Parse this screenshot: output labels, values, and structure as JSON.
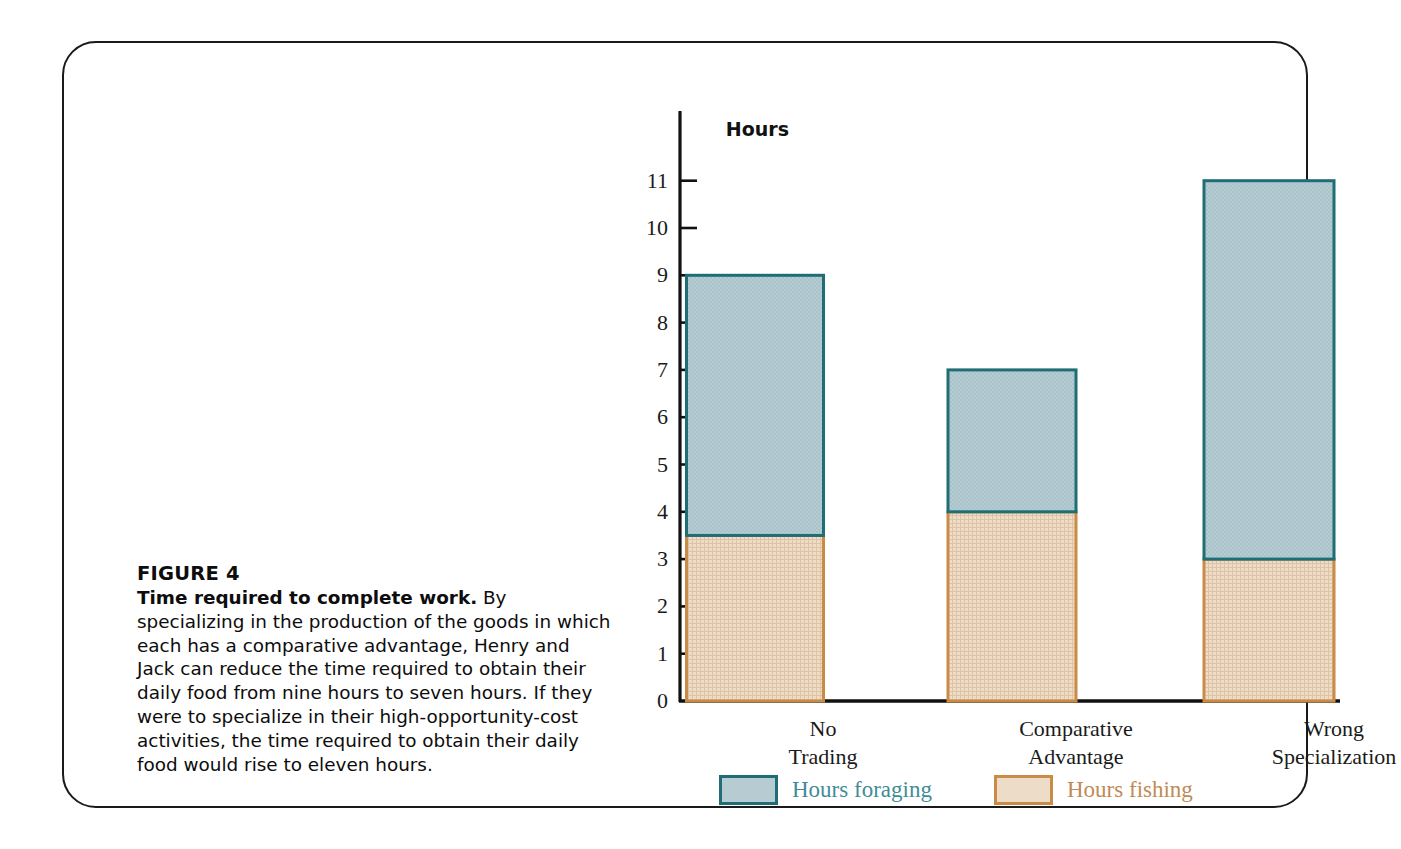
{
  "figure": {
    "number_label": "FIGURE 4",
    "caption_lead": "Time required to complete work.",
    "caption_body": " By specializing in the production of the goods in which each has a comparative advantage, Henry and Jack can reduce the time required to obtain their daily food from nine hours to seven hours. If they were to specialize in their high-opportunity-cost activities, the time required to obtain their daily food would rise to eleven hours."
  },
  "colors": {
    "foraging_fill": "#b7ccd2",
    "foraging_border": "#1f6e75",
    "foraging_text": "#3f8c98",
    "fishing_fill": "#e9d6c1",
    "fishing_border": "#c98b46",
    "fishing_text": "#c08a55",
    "axis": "#111111",
    "frame": "#1a1a1a"
  },
  "chart_data": {
    "type": "bar",
    "stacked": true,
    "title": "",
    "xlabel": "",
    "ylabel": "Hours",
    "ylim": [
      0,
      11
    ],
    "yticks": [
      0,
      1,
      2,
      3,
      4,
      5,
      6,
      7,
      8,
      9,
      10,
      11
    ],
    "ytick_labels": [
      "0",
      "1",
      "2",
      "3",
      "4",
      "5",
      "6",
      "7",
      "8",
      "9",
      "10",
      "11"
    ],
    "grid": false,
    "legend_position": "bottom",
    "categories": [
      "No Trading",
      "Comparative Advantage",
      "Wrong Specialization"
    ],
    "category_lines": [
      [
        "No",
        "Trading"
      ],
      [
        "Comparative",
        "Advantage"
      ],
      [
        "Wrong",
        "Specialization"
      ]
    ],
    "series": [
      {
        "name": "Hours fishing",
        "values": [
          3.5,
          4,
          3
        ]
      },
      {
        "name": "Hours foraging",
        "values": [
          5.5,
          3,
          8
        ]
      }
    ],
    "totals": [
      9,
      7,
      11
    ],
    "legend": [
      {
        "label": "Hours foraging"
      },
      {
        "label": "Hours fishing"
      }
    ]
  }
}
